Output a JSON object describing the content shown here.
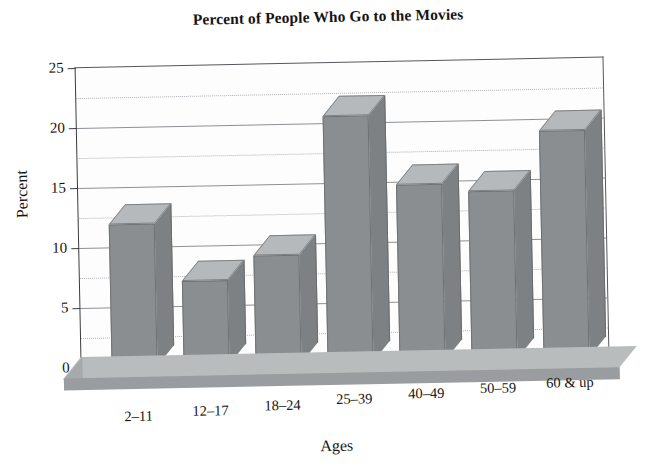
{
  "chart_data": {
    "type": "bar",
    "title": "Percent of People Who Go to the Movies",
    "xlabel": "Ages",
    "ylabel": "Percent",
    "categories": [
      "2–11",
      "12–17",
      "18–24",
      "25–39",
      "40–49",
      "50–59",
      "60 & up"
    ],
    "values": [
      13.5,
      8.7,
      10.7,
      22.2,
      16.3,
      15.7,
      20.6
    ],
    "ylim": [
      0,
      25
    ],
    "ytick_labels": [
      "0",
      "5",
      "10",
      "15",
      "20",
      "25"
    ],
    "ytick_values": [
      0,
      5,
      10,
      15,
      20,
      25
    ],
    "gridline_step": 2.5,
    "grid": true,
    "legend": "none",
    "style": "3d-column",
    "colors": {
      "bar_front": "#8b8e90",
      "bar_top": "#b6b9bb",
      "bar_side": "#7e8183",
      "floor": "#b9bcbd",
      "gridline": "#8d9195",
      "axis": "#3a3d40",
      "text": "#151515",
      "background": "#ffffff"
    }
  }
}
